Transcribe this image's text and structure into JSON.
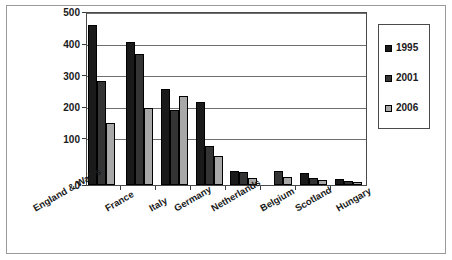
{
  "chart_data": {
    "type": "bar",
    "title": "",
    "subtitle": "",
    "xlabel": "",
    "ylabel": "",
    "ylim": [
      0,
      550
    ],
    "yticks": [
      0,
      100,
      200,
      300,
      400,
      500
    ],
    "ytick_labels": [
      "0",
      "100",
      "200",
      "300",
      "400",
      "500"
    ],
    "grid": true,
    "grid_axis": "y",
    "legend_position": "right",
    "categories": [
      "England & Wales",
      "France",
      "Italy",
      "Germany",
      "Netherlands",
      "Belgium",
      "Scotland",
      "Hungary"
    ],
    "series": [
      {
        "name": "1995",
        "color": "#1a1a1a",
        "values": [
          505,
          452,
          305,
          262,
          45,
          null,
          38,
          19
        ]
      },
      {
        "name": "2001",
        "color": "#343434",
        "values": [
          328,
          415,
          237,
          122,
          42,
          45,
          23,
          13
        ]
      },
      {
        "name": "2006",
        "color": "#a8a8a8",
        "values": [
          195,
          242,
          280,
          92,
          22,
          25,
          15,
          10
        ]
      }
    ]
  },
  "legend": {
    "entries": [
      {
        "label": "1995"
      },
      {
        "label": "2001"
      },
      {
        "label": "2006"
      }
    ]
  },
  "axis": {
    "y_tick_labels": [
      "500",
      "400",
      "300",
      "200",
      "100",
      "0"
    ]
  }
}
